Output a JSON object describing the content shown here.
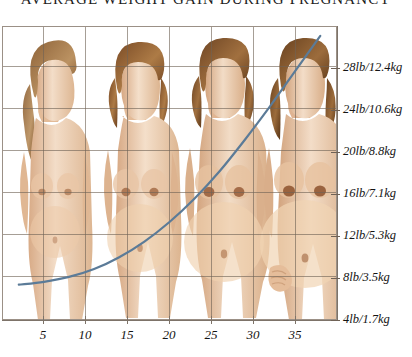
{
  "chart_data": {
    "type": "line",
    "title": "AVERAGE WEIGHT GAIN DURING PREGNANCY",
    "xlabel": "",
    "ylabel": "",
    "xlim": [
      0,
      40
    ],
    "ylim": [
      0,
      30
    ],
    "grid": true,
    "legend": false,
    "x_tick_labels": [
      "5",
      "10",
      "15",
      "20",
      "25",
      "30",
      "35"
    ],
    "x_tick_values": [
      5,
      10,
      15,
      20,
      25,
      30,
      35
    ],
    "y_tick_labels": [
      "4lb/1.7kg",
      "8lb/3.5kg",
      "12lb/5.3kg",
      "16lb/7.1kg",
      "20lb/8.8kg",
      "24lb/10.6kg",
      "28lb/12.4kg"
    ],
    "y_tick_values": [
      4,
      8,
      12,
      16,
      20,
      24,
      28
    ],
    "series": [
      {
        "name": "Average weight gain",
        "color": "#5b7b98",
        "x": [
          2,
          5,
          8,
          11,
          14,
          17,
          20,
          23,
          26,
          29,
          32,
          35,
          38
        ],
        "y": [
          3.6,
          3.9,
          4.4,
          5.2,
          6.4,
          8.0,
          10.0,
          12.4,
          15.2,
          18.4,
          21.8,
          25.4,
          29.0
        ]
      }
    ],
    "annotations": [],
    "background_figures": [
      {
        "stage": "first trimester",
        "pose": "standing profile"
      },
      {
        "stage": "second trimester",
        "pose": "standing frontal"
      },
      {
        "stage": "third trimester",
        "pose": "standing frontal"
      },
      {
        "stage": "full term",
        "pose": "standing frontal, hands at abdomen"
      }
    ]
  },
  "colors": {
    "curve": "#5b7b98",
    "grid": "#6f6256",
    "axis": "#7d7369",
    "text": "#141414",
    "skin_light": "#f2dcc6",
    "skin_mid": "#e6c3a1",
    "skin_shadow": "#cfa17c",
    "hair_light": "#b99066",
    "hair_dark": "#6e4a2c",
    "background": "#ffffff"
  }
}
